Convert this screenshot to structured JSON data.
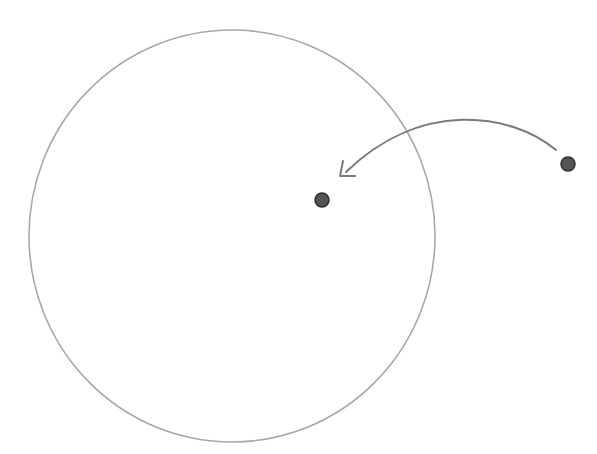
{
  "diagram": {
    "circle": {
      "cx": 232,
      "cy": 236,
      "rx": 203,
      "ry": 206,
      "stroke": "#a8a8a8"
    },
    "points": [
      {
        "id": "inner-point",
        "cx": 322,
        "cy": 200,
        "r": 7,
        "fill": "#555555"
      },
      {
        "id": "outer-point",
        "cx": 568,
        "cy": 164,
        "r": 7,
        "fill": "#555555"
      }
    ],
    "arrow": {
      "from": "outer-point",
      "to": "inner-point",
      "stroke": "#7a7a7a"
    }
  }
}
